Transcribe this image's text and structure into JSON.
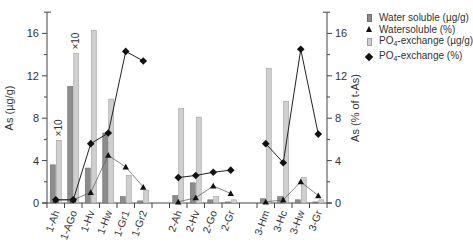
{
  "chart_data": {
    "type": "bar",
    "title": "",
    "xlabel": "",
    "ylabel": "As (µg/g)",
    "ylabel_right": "As (% of t-As)",
    "ylim": [
      0,
      18
    ],
    "ylim_right": [
      0,
      18
    ],
    "yticks": [
      0,
      4,
      8,
      12,
      16
    ],
    "yticks_right": [
      0,
      4,
      8,
      12,
      16
    ],
    "categories": [
      "1-Ah",
      "1-AGo",
      "1-Hv",
      "1-Hw",
      "1-Gr1",
      "1-Gr2",
      "2-Ah",
      "2-Hv",
      "2-Go",
      "2-Gr",
      "3-Hm",
      "3-Hc",
      "3-Hw",
      "3-Gr"
    ],
    "groups": [
      [
        "1-Ah",
        "1-AGo",
        "1-Hv",
        "1-Hw",
        "1-Gr1",
        "1-Gr2"
      ],
      [
        "2-Ah",
        "2-Hv",
        "2-Go",
        "2-Gr"
      ],
      [
        "3-Hm",
        "3-Hc",
        "3-Hw",
        "3-Gr"
      ]
    ],
    "series": [
      {
        "name": "Water soluble (µg/g)",
        "kind": "bar",
        "axis": "left",
        "color": "#8c8c8c",
        "values": [
          3.6,
          11.0,
          3.3,
          6.6,
          0.6,
          0.2,
          0.7,
          1.9,
          0.3,
          0.1,
          0.4,
          0.6,
          0.3,
          0.1
        ]
      },
      {
        "name": "Watersoluble (%)",
        "kind": "line",
        "marker": "triangle",
        "axis": "right",
        "color": "#111111",
        "values": [
          0.3,
          0.3,
          1.0,
          4.5,
          3.4,
          1.5,
          0.1,
          0.5,
          1.6,
          0.9,
          0.1,
          0.3,
          2.0,
          0.7
        ]
      },
      {
        "name": "PO4-exchange (µg/g)",
        "kind": "bar",
        "axis": "left",
        "color": "#cfcfcf",
        "values": [
          5.9,
          14.1,
          16.3,
          9.8,
          2.6,
          1.2,
          8.9,
          8.1,
          0.6,
          0.3,
          12.7,
          9.6,
          2.4,
          0.3
        ]
      },
      {
        "name": "PO4-exchange (%)",
        "kind": "line",
        "marker": "diamond",
        "axis": "right",
        "color": "#111111",
        "values": [
          0.3,
          0.3,
          5.6,
          6.6,
          14.3,
          13.4,
          2.4,
          2.6,
          2.9,
          3.1,
          5.6,
          3.8,
          14.5,
          6.5
        ]
      }
    ],
    "annotations": [
      {
        "text": "×10",
        "category": "1-Ah"
      },
      {
        "text": "×10",
        "category": "1-AGo"
      }
    ],
    "legend_position": "top-right",
    "grid": false
  },
  "legend": {
    "items": [
      {
        "label": "Water soluble (µg/g)"
      },
      {
        "label": "Watersoluble (%)"
      },
      {
        "label_pre": "PO",
        "label_sub": "4",
        "label_post": "-exchange (µg/g)"
      },
      {
        "label_pre": "PO",
        "label_sub": "4",
        "label_post": "-exchange (%)"
      }
    ]
  }
}
